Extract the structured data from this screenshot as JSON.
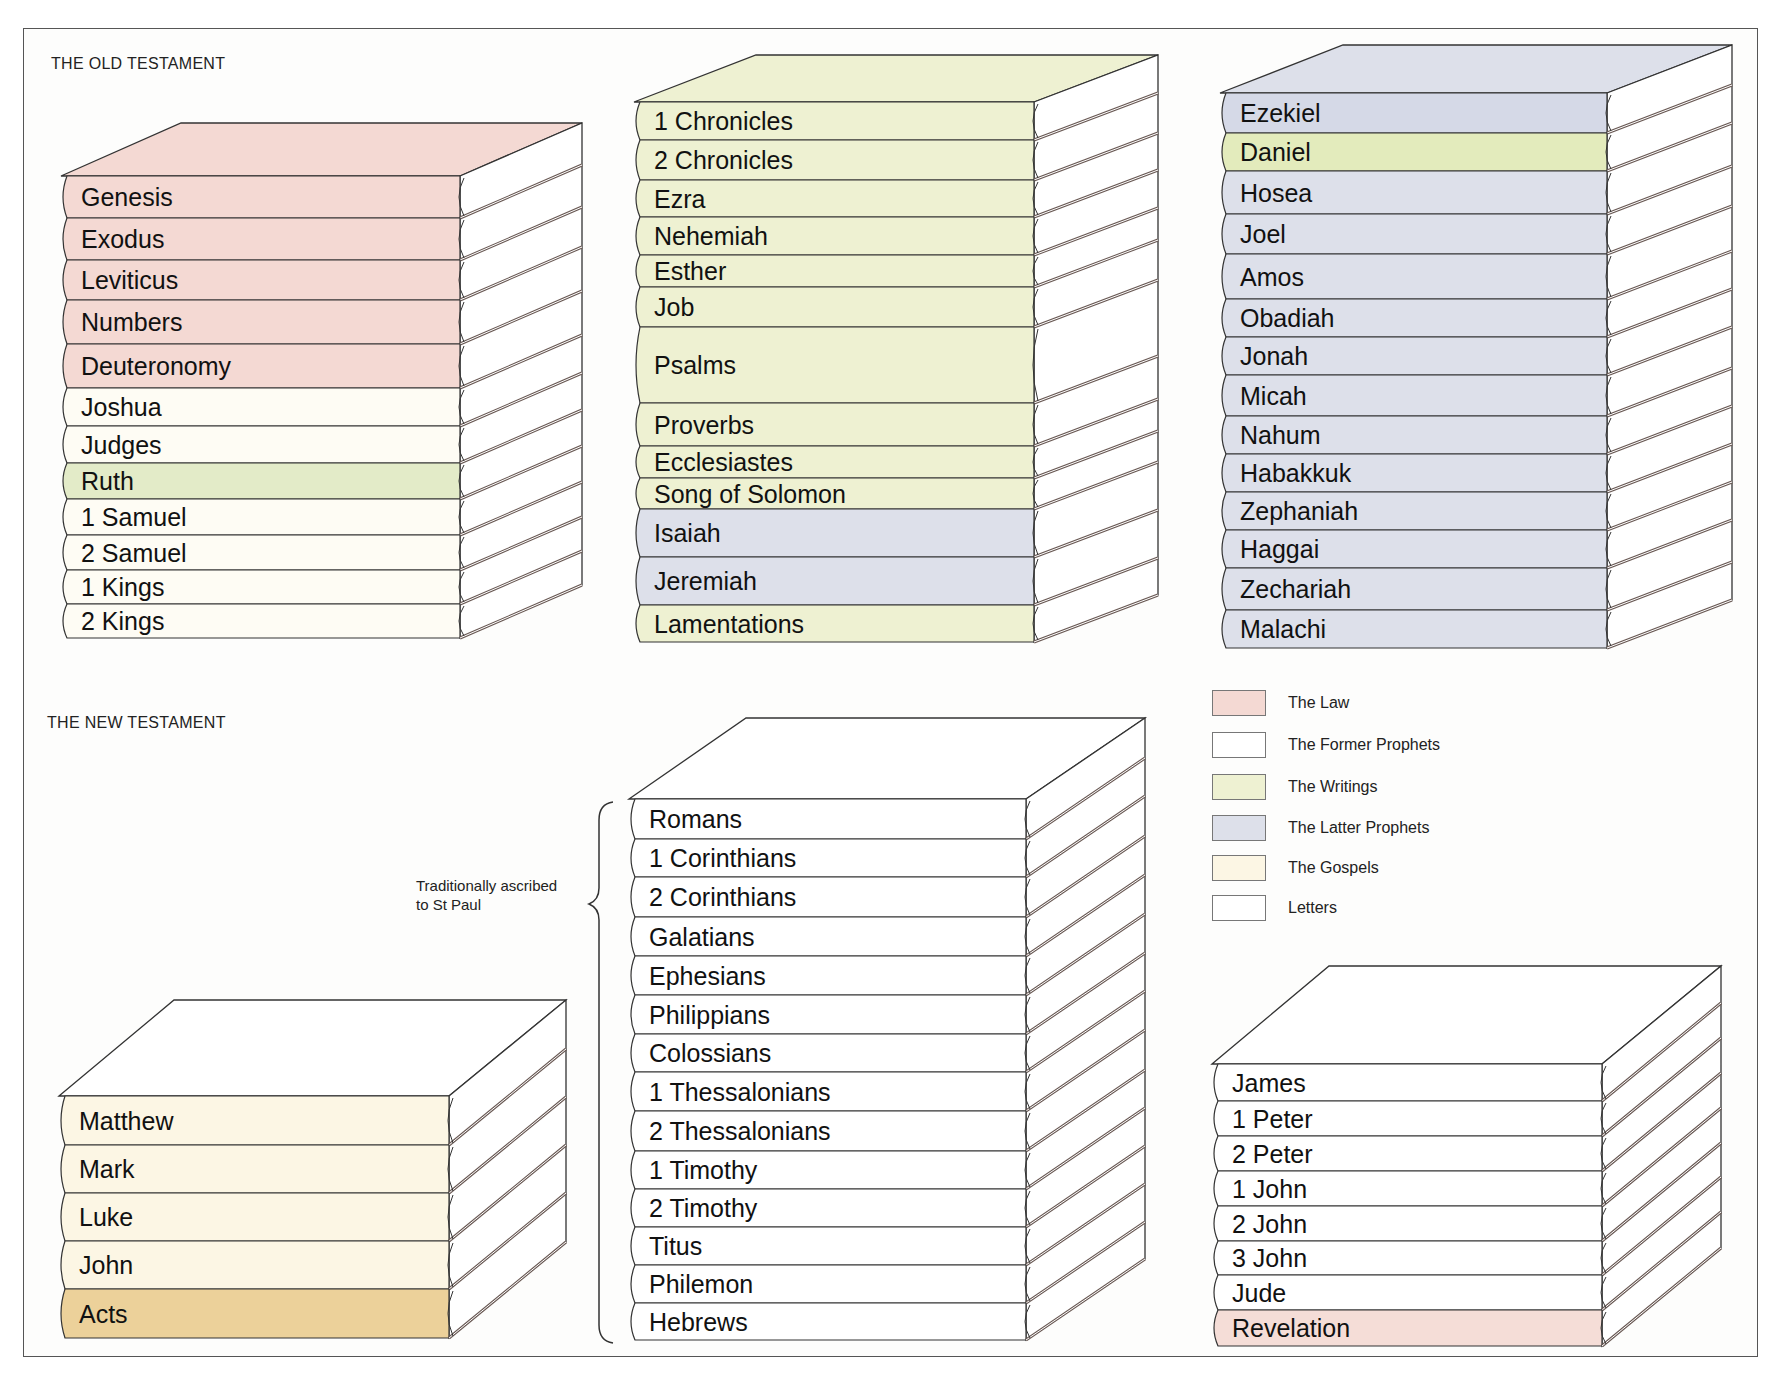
{
  "colors": {
    "law": "#f4d9d3",
    "former_prophets": "#fefcf4",
    "writings": "#eef1d2",
    "writings_strong": "#dfe9b8",
    "latter_prophets": "#dde0ea",
    "gospels": "#fcf6e4",
    "acts": "#ecd19a",
    "letters": "#ffffff",
    "revelation": "#f5ddd7",
    "outline": "#333333",
    "page_edge": "#ffffff"
  },
  "old_testament": {
    "title": "THE OLD TESTAMENT",
    "stacks": [
      {
        "id": "ot-stack-1",
        "x": 59,
        "y_top": 123,
        "y_first": 176,
        "spine_width": 401,
        "depth_x": 122,
        "top_color": "#f4d9d3",
        "books": [
          {
            "label": "Genesis",
            "h": 42,
            "color": "#f4d9d3"
          },
          {
            "label": "Exodus",
            "h": 42,
            "color": "#f4d9d3"
          },
          {
            "label": "Leviticus",
            "h": 40,
            "color": "#f4d9d3"
          },
          {
            "label": "Numbers",
            "h": 44,
            "color": "#f4d9d3"
          },
          {
            "label": "Deuteronomy",
            "h": 44,
            "color": "#f4d9d3"
          },
          {
            "label": "Joshua",
            "h": 38,
            "color": "#fefcf4"
          },
          {
            "label": "Judges",
            "h": 37,
            "color": "#fefcf4"
          },
          {
            "label": "Ruth",
            "h": 36,
            "color": "#e3ebc8"
          },
          {
            "label": "1 Samuel",
            "h": 36,
            "color": "#fefcf4"
          },
          {
            "label": "2 Samuel",
            "h": 35,
            "color": "#fefcf4"
          },
          {
            "label": "1 Kings",
            "h": 34,
            "color": "#fefcf4"
          },
          {
            "label": "2 Kings",
            "h": 34,
            "color": "#fefcf4"
          }
        ]
      },
      {
        "id": "ot-stack-2",
        "x": 632,
        "y_top": 55,
        "y_first": 102,
        "spine_width": 402,
        "depth_x": 124,
        "top_color": "#eef1d2",
        "books": [
          {
            "label": "1 Chronicles",
            "h": 38,
            "color": "#eef1d2"
          },
          {
            "label": "2 Chronicles",
            "h": 40,
            "color": "#eef1d2"
          },
          {
            "label": "Ezra",
            "h": 37,
            "color": "#eef1d2"
          },
          {
            "label": "Nehemiah",
            "h": 38,
            "color": "#eef1d2"
          },
          {
            "label": "Esther",
            "h": 32,
            "color": "#eef1d2"
          },
          {
            "label": "Job",
            "h": 40,
            "color": "#eef1d2"
          },
          {
            "label": "Psalms",
            "h": 76,
            "color": "#eef1d2"
          },
          {
            "label": "Proverbs",
            "h": 43,
            "color": "#eef1d2"
          },
          {
            "label": "Ecclesiastes",
            "h": 32,
            "color": "#eef1d2"
          },
          {
            "label": "Song of Solomon",
            "h": 31,
            "color": "#eef1d2"
          },
          {
            "label": "Isaiah",
            "h": 48,
            "color": "#dde0ea"
          },
          {
            "label": "Jeremiah",
            "h": 48,
            "color": "#dde0ea"
          },
          {
            "label": "Lamentations",
            "h": 37,
            "color": "#eef1d2"
          }
        ]
      },
      {
        "id": "ot-stack-3",
        "x": 1218,
        "y_top": 45,
        "y_first": 93,
        "spine_width": 389,
        "depth_x": 125,
        "top_color": "#dde0ea",
        "books": [
          {
            "label": "Ezekiel",
            "h": 40,
            "color": "#d5d9e7"
          },
          {
            "label": "Daniel",
            "h": 38,
            "color": "#e3ebbc"
          },
          {
            "label": "Hosea",
            "h": 43,
            "color": "#dde0ea"
          },
          {
            "label": "Joel",
            "h": 40,
            "color": "#dde0ea"
          },
          {
            "label": "Amos",
            "h": 45,
            "color": "#dde0ea"
          },
          {
            "label": "Obadiah",
            "h": 38,
            "color": "#dde0ea"
          },
          {
            "label": "Jonah",
            "h": 38,
            "color": "#dde0ea"
          },
          {
            "label": "Micah",
            "h": 41,
            "color": "#dde0ea"
          },
          {
            "label": "Nahum",
            "h": 38,
            "color": "#dde0ea"
          },
          {
            "label": "Habakkuk",
            "h": 38,
            "color": "#dde0ea"
          },
          {
            "label": "Zephaniah",
            "h": 38,
            "color": "#dde0ea"
          },
          {
            "label": "Haggai",
            "h": 38,
            "color": "#dde0ea"
          },
          {
            "label": "Zechariah",
            "h": 42,
            "color": "#dde0ea"
          },
          {
            "label": "Malachi",
            "h": 38,
            "color": "#dde0ea"
          }
        ]
      }
    ]
  },
  "new_testament": {
    "title": "THE NEW TESTAMENT",
    "annotation": [
      "Traditionally ascribed",
      "to St Paul"
    ],
    "stacks": [
      {
        "id": "nt-stack-1",
        "x": 57,
        "y_top": 1000,
        "y_first": 1096,
        "spine_width": 392,
        "depth_x": 117,
        "top_color": "#ffffff",
        "books": [
          {
            "label": "Matthew",
            "h": 49,
            "color": "#fcf6e4"
          },
          {
            "label": "Mark",
            "h": 48,
            "color": "#fcf6e4"
          },
          {
            "label": "Luke",
            "h": 48,
            "color": "#fcf6e4"
          },
          {
            "label": "John",
            "h": 48,
            "color": "#fcf6e4"
          },
          {
            "label": "Acts",
            "h": 49,
            "color": "#ecd19a"
          }
        ]
      },
      {
        "id": "nt-stack-2",
        "x": 627,
        "y_top": 718,
        "y_first": 799,
        "spine_width": 399,
        "depth_x": 119,
        "top_color": "#ffffff",
        "books": [
          {
            "label": "Romans",
            "h": 40,
            "color": "#ffffff"
          },
          {
            "label": "1 Corinthians",
            "h": 38,
            "color": "#ffffff"
          },
          {
            "label": "2 Corinthians",
            "h": 40,
            "color": "#ffffff"
          },
          {
            "label": "Galatians",
            "h": 39,
            "color": "#ffffff"
          },
          {
            "label": "Ephesians",
            "h": 39,
            "color": "#ffffff"
          },
          {
            "label": "Philippians",
            "h": 39,
            "color": "#ffffff"
          },
          {
            "label": "Colossians",
            "h": 38,
            "color": "#ffffff"
          },
          {
            "label": "1 Thessalonians",
            "h": 39,
            "color": "#ffffff"
          },
          {
            "label": "2 Thessalonians",
            "h": 40,
            "color": "#ffffff"
          },
          {
            "label": "1 Timothy",
            "h": 38,
            "color": "#ffffff"
          },
          {
            "label": "2 Timothy",
            "h": 38,
            "color": "#ffffff"
          },
          {
            "label": "Titus",
            "h": 38,
            "color": "#ffffff"
          },
          {
            "label": "Philemon",
            "h": 38,
            "color": "#ffffff"
          },
          {
            "label": "Hebrews",
            "h": 37,
            "color": "#ffffff"
          }
        ]
      },
      {
        "id": "nt-stack-3",
        "x": 1210,
        "y_top": 966,
        "y_first": 1064,
        "spine_width": 392,
        "depth_x": 119,
        "top_color": "#ffffff",
        "books": [
          {
            "label": "James",
            "h": 37,
            "color": "#ffffff"
          },
          {
            "label": "1 Peter",
            "h": 35,
            "color": "#ffffff"
          },
          {
            "label": "2 Peter",
            "h": 35,
            "color": "#ffffff"
          },
          {
            "label": "1 John",
            "h": 35,
            "color": "#ffffff"
          },
          {
            "label": "2 John",
            "h": 35,
            "color": "#ffffff"
          },
          {
            "label": "3 John",
            "h": 34,
            "color": "#ffffff"
          },
          {
            "label": "Jude",
            "h": 35,
            "color": "#ffffff"
          },
          {
            "label": "Revelation",
            "h": 36,
            "color": "#f5ddd7"
          }
        ]
      }
    ]
  },
  "legend": {
    "items": [
      {
        "label": "The Law",
        "color": "#f4d9d3"
      },
      {
        "label": "The Former Prophets",
        "color": "#ffffff"
      },
      {
        "label": "The Writings",
        "color": "#eef1d2"
      },
      {
        "label": "The Latter Prophets",
        "color": "#dde0ea"
      },
      {
        "label": "The Gospels",
        "color": "#fcf6e4"
      },
      {
        "label": "Letters",
        "color": "#ffffff"
      }
    ]
  }
}
